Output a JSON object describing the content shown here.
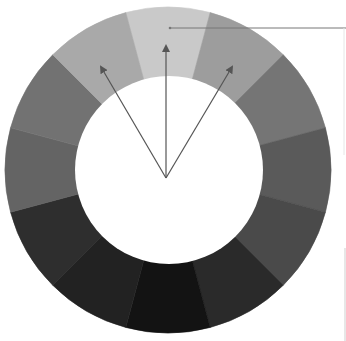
{
  "diagram": {
    "type": "color-wheel-grayscale",
    "segment_count": 12,
    "center": [
      168,
      170
    ],
    "outer_radius": 163,
    "inner_radius": 94,
    "segments": [
      {
        "index": 0,
        "angle_center_deg": 0,
        "color": "#c9c9c9",
        "note": "top, lightest"
      },
      {
        "index": 1,
        "angle_center_deg": 30,
        "color": "#9d9d9d"
      },
      {
        "index": 2,
        "angle_center_deg": 60,
        "color": "#757575"
      },
      {
        "index": 3,
        "angle_center_deg": 90,
        "color": "#5a5a5a"
      },
      {
        "index": 4,
        "angle_center_deg": 120,
        "color": "#4a4a4a"
      },
      {
        "index": 5,
        "angle_center_deg": 150,
        "color": "#2a2a2a"
      },
      {
        "index": 6,
        "angle_center_deg": 180,
        "color": "#131313",
        "note": "bottom, darkest"
      },
      {
        "index": 7,
        "angle_center_deg": 210,
        "color": "#222222"
      },
      {
        "index": 8,
        "angle_center_deg": 240,
        "color": "#2e2e2e"
      },
      {
        "index": 9,
        "angle_center_deg": 270,
        "color": "#646464"
      },
      {
        "index": 10,
        "angle_center_deg": 300,
        "color": "#727272"
      },
      {
        "index": 11,
        "angle_center_deg": 330,
        "color": "#a9a9a9"
      }
    ],
    "arrows": {
      "origin": [
        166,
        178
      ],
      "color": "#555555",
      "targets": [
        {
          "name": "left",
          "point": [
            101,
            67
          ]
        },
        {
          "name": "center",
          "point": [
            166,
            46
          ]
        },
        {
          "name": "right",
          "point": [
            232,
            67
          ]
        }
      ]
    },
    "leader_line": {
      "from": [
        170,
        28
      ],
      "to": [
        346,
        28
      ],
      "color": "#777777"
    },
    "edge_marks": [
      {
        "x": 344,
        "y1": 28,
        "y2": 155,
        "color": "#e6e6e6"
      },
      {
        "x": 345,
        "y1": 248,
        "y2": 341,
        "color": "#cfcfcf"
      }
    ]
  }
}
